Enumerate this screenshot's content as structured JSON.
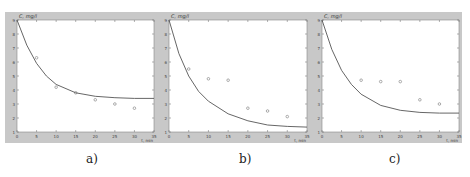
{
  "chart_data": [
    {
      "type": "scatter",
      "panel": "a)",
      "title": "",
      "xlabel": "t, min",
      "ylabel": "C, mg/l",
      "xlim": [
        0,
        35
      ],
      "ylim": [
        1,
        9
      ],
      "xticks": [
        0,
        5,
        10,
        15,
        20,
        25,
        30,
        35
      ],
      "yticks": [
        1,
        2,
        3,
        4,
        5,
        6,
        7,
        8,
        9
      ],
      "grid": false,
      "series": [
        {
          "name": "measured",
          "marker": "o",
          "x": [
            5,
            10,
            15,
            20,
            25,
            30
          ],
          "y": [
            6.3,
            4.2,
            3.8,
            3.3,
            3.0,
            2.7
          ]
        },
        {
          "name": "model",
          "style": "line",
          "x": [
            0,
            2.5,
            5,
            7.5,
            10,
            15,
            20,
            25,
            30,
            35
          ],
          "y": [
            9.0,
            7.2,
            5.9,
            5.0,
            4.4,
            3.8,
            3.55,
            3.45,
            3.4,
            3.4
          ]
        }
      ]
    },
    {
      "type": "scatter",
      "panel": "b)",
      "title": "",
      "xlabel": "t, min",
      "ylabel": "C, mg/l",
      "xlim": [
        0,
        35
      ],
      "ylim": [
        1,
        9
      ],
      "xticks": [
        0,
        5,
        10,
        15,
        20,
        25,
        30,
        35
      ],
      "yticks": [
        1,
        2,
        3,
        4,
        5,
        6,
        7,
        8,
        9
      ],
      "grid": false,
      "series": [
        {
          "name": "measured",
          "marker": "o",
          "x": [
            5,
            10,
            15,
            20,
            25,
            30
          ],
          "y": [
            5.5,
            4.8,
            4.7,
            2.7,
            2.5,
            2.1
          ]
        },
        {
          "name": "model",
          "style": "line",
          "x": [
            0,
            2.5,
            5,
            7.5,
            10,
            15,
            20,
            25,
            30,
            35
          ],
          "y": [
            9.0,
            6.6,
            5.0,
            3.9,
            3.2,
            2.3,
            1.8,
            1.5,
            1.4,
            1.35
          ]
        }
      ]
    },
    {
      "type": "scatter",
      "panel": "c)",
      "title": "",
      "xlabel": "t, min",
      "ylabel": "C, mg/l",
      "xlim": [
        0,
        35
      ],
      "ylim": [
        1,
        9
      ],
      "xticks": [
        0,
        5,
        10,
        15,
        20,
        25,
        30,
        35
      ],
      "yticks": [
        1,
        2,
        3,
        4,
        5,
        6,
        7,
        8,
        9
      ],
      "grid": false,
      "series": [
        {
          "name": "measured",
          "marker": "o",
          "x": [
            10,
            15,
            20,
            25,
            30
          ],
          "y": [
            4.7,
            4.6,
            4.6,
            3.3,
            3.0
          ]
        },
        {
          "name": "model",
          "style": "line",
          "x": [
            0,
            2.5,
            5,
            7.5,
            10,
            15,
            20,
            25,
            30,
            35
          ],
          "y": [
            9.0,
            6.9,
            5.4,
            4.4,
            3.7,
            2.9,
            2.55,
            2.4,
            2.35,
            2.35
          ]
        }
      ]
    }
  ],
  "panels": [
    {
      "caption": "a)",
      "ylabel": "C, mg/l",
      "xlabel": "t, min"
    },
    {
      "caption": "b)",
      "ylabel": "C, mg/l",
      "xlabel": "t, min"
    },
    {
      "caption": "c)",
      "ylabel": "C, mg/l",
      "xlabel": "t, min"
    }
  ]
}
